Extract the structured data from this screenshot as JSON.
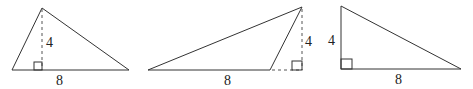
{
  "figure": {
    "triangles": [
      {
        "id": "acute",
        "height_label": "4",
        "base_label": "8",
        "altitude": "interior"
      },
      {
        "id": "obtuse",
        "height_label": "4",
        "base_label": "8",
        "altitude": "exterior"
      },
      {
        "id": "right",
        "height_label": "4",
        "base_label": "8",
        "altitude": "leg"
      }
    ]
  },
  "colors": {
    "stroke": "#333333",
    "background": "#ffffff"
  }
}
